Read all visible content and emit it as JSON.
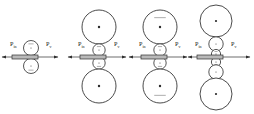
{
  "figure": {
    "type": "mechanical-schematic",
    "background_color": "#ffffff",
    "line_color": "#2b2b2b",
    "rod_fill_color": "#b9b9b9",
    "baseline_y": 57,
    "width": 254,
    "height": 114
  },
  "labels": {
    "force_in_symbol": "P",
    "force_in_subscript": "in",
    "force_out_symbol": "P",
    "force_out_subscript": "v"
  },
  "groups": [
    {
      "id": "stage-1",
      "index": 1,
      "center_x": 31,
      "label_left": {
        "symbol": "P",
        "sub": "in",
        "x": 10,
        "y": 46
      },
      "label_right": {
        "symbol": "P",
        "sub": "v",
        "x": 46,
        "y": 46
      },
      "rod": {
        "x": 12,
        "y": 55,
        "width": 26,
        "height": 4
      },
      "arrow_left": {
        "x1": 14,
        "x2": 2,
        "y": 57
      },
      "arrow_right": {
        "x1": 36,
        "x2": 58,
        "y": 57
      },
      "circles": [
        {
          "role": "upper-roller",
          "size": "sm",
          "cx": 31,
          "cy": 48,
          "r": 7.5,
          "tick": "up"
        },
        {
          "role": "lower-roller",
          "size": "sm",
          "cx": 31,
          "cy": 66,
          "r": 7.5,
          "tick": "down"
        }
      ]
    },
    {
      "id": "stage-2",
      "index": 2,
      "center_x": 99,
      "label_left": {
        "symbol": "P",
        "sub": "in",
        "x": 78,
        "y": 46
      },
      "label_right": {
        "symbol": "P",
        "sub": "v",
        "x": 114,
        "y": 46
      },
      "rod": {
        "x": 80,
        "y": 55,
        "width": 26,
        "height": 4
      },
      "arrow_left": {
        "x1": 82,
        "x2": 68,
        "y": 57
      },
      "arrow_right": {
        "x1": 104,
        "x2": 126,
        "y": 57
      },
      "circles": [
        {
          "role": "upper-wheel",
          "size": "lg",
          "cx": 99,
          "cy": 27,
          "r": 17,
          "tick": "none"
        },
        {
          "role": "upper-roller",
          "size": "sm",
          "cx": 99,
          "cy": 50,
          "r": 6.2,
          "tick": "up"
        },
        {
          "role": "lower-roller",
          "size": "sm",
          "cx": 99,
          "cy": 63,
          "r": 6.2,
          "tick": "down"
        },
        {
          "role": "lower-wheel",
          "size": "lg",
          "cx": 99,
          "cy": 86,
          "r": 17,
          "tick": "none"
        }
      ]
    },
    {
      "id": "stage-3",
      "index": 3,
      "center_x": 160,
      "label_left": {
        "symbol": "P",
        "sub": "in",
        "x": 139,
        "y": 46
      },
      "label_right": {
        "symbol": "P",
        "sub": "v",
        "x": 175,
        "y": 46
      },
      "rod": {
        "x": 141,
        "y": 55,
        "width": 26,
        "height": 4
      },
      "arrow_left": {
        "x1": 143,
        "x2": 129,
        "y": 57
      },
      "arrow_right": {
        "x1": 165,
        "x2": 187,
        "y": 57
      },
      "circles": [
        {
          "role": "upper-wheel",
          "size": "lg",
          "cx": 160,
          "cy": 27,
          "r": 17,
          "tick": "up"
        },
        {
          "role": "upper-roller",
          "size": "sm",
          "cx": 160,
          "cy": 50,
          "r": 6.2,
          "tick": "up"
        },
        {
          "role": "lower-roller",
          "size": "sm",
          "cx": 160,
          "cy": 63,
          "r": 6.2,
          "tick": "down"
        },
        {
          "role": "lower-wheel",
          "size": "lg",
          "cx": 160,
          "cy": 86,
          "r": 17,
          "tick": "down"
        }
      ]
    },
    {
      "id": "stage-4",
      "index": 4,
      "center_x": 216,
      "label_left": {
        "symbol": "P",
        "sub": "in",
        "x": 195,
        "y": 46
      },
      "label_right": {
        "symbol": "P",
        "sub": "v",
        "x": 231,
        "y": 46
      },
      "rod": {
        "x": 197,
        "y": 55,
        "width": 26,
        "height": 4
      },
      "arrow_left": {
        "x1": 199,
        "x2": 188,
        "y": 57
      },
      "arrow_right": {
        "x1": 221,
        "x2": 250,
        "y": 57
      },
      "circles": [
        {
          "role": "upper-wheel",
          "size": "lg",
          "cx": 216,
          "cy": 21,
          "r": 16,
          "tick": "none"
        },
        {
          "role": "upper-idler",
          "size": "md",
          "cx": 216,
          "cy": 44,
          "r": 7.2,
          "tick": "none"
        },
        {
          "role": "upper-roller",
          "size": "sm",
          "cx": 216,
          "cy": 54,
          "r": 4.6,
          "tick": "up"
        },
        {
          "role": "lower-roller",
          "size": "sm",
          "cx": 216,
          "cy": 62,
          "r": 4.6,
          "tick": "down"
        },
        {
          "role": "lower-idler",
          "size": "md",
          "cx": 216,
          "cy": 72,
          "r": 7.2,
          "tick": "none"
        },
        {
          "role": "lower-wheel",
          "size": "lg",
          "cx": 216,
          "cy": 94,
          "r": 16,
          "tick": "none"
        }
      ]
    }
  ]
}
